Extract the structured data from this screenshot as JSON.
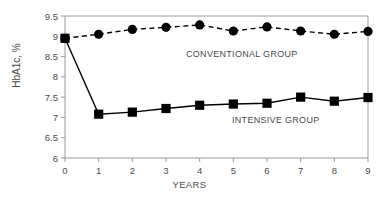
{
  "chart_data": {
    "type": "line",
    "title": "",
    "xlabel": "YEARS",
    "ylabel": "HbA1c, %",
    "x": [
      0,
      1,
      2,
      3,
      4,
      5,
      6,
      7,
      8,
      9
    ],
    "xlim": [
      0,
      9
    ],
    "ylim": [
      6,
      9.5
    ],
    "xticks": [
      "0",
      "1",
      "2",
      "3",
      "4",
      "5",
      "6",
      "7",
      "8",
      "9"
    ],
    "yticks": [
      "6",
      "6.5",
      "7",
      "7.5",
      "8",
      "8.5",
      "9",
      "9.5"
    ],
    "ytick_values": [
      6,
      6.5,
      7,
      7.5,
      8,
      8.5,
      9,
      9.5
    ],
    "grid": false,
    "legend_position": "inline-annotations",
    "series": [
      {
        "name": "CONVENTIONAL GROUP",
        "marker": "circle",
        "linestyle": "dashed",
        "color": "#000000",
        "values": [
          8.95,
          9.05,
          9.17,
          9.22,
          9.28,
          9.13,
          9.23,
          9.13,
          9.05,
          9.12
        ]
      },
      {
        "name": "INTENSIVE GROUP",
        "marker": "square",
        "linestyle": "solid",
        "color": "#000000",
        "values": [
          8.95,
          7.08,
          7.13,
          7.22,
          7.3,
          7.33,
          7.35,
          7.5,
          7.4,
          7.49
        ]
      }
    ],
    "annotations": [
      {
        "text": "CONVENTIONAL GROUP",
        "x": 4.6,
        "y": 8.52
      },
      {
        "text": "INTENSIVE GROUP",
        "x": 6.0,
        "y": 6.92
      }
    ]
  },
  "axis": {
    "x_title": "YEARS",
    "y_title": "HbA1c, %"
  }
}
